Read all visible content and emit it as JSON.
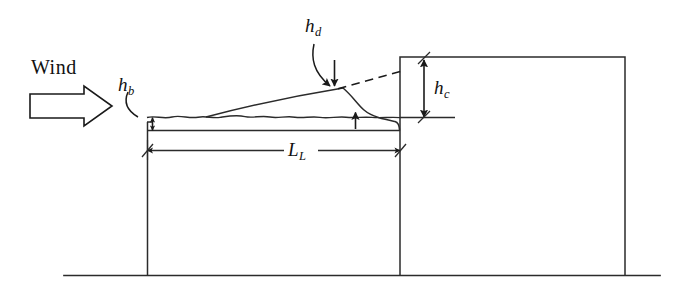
{
  "figure": {
    "type": "engineering-diagram",
    "background_color": "#ffffff",
    "line_color": "#1a1a1a"
  },
  "labels": {
    "wind": "Wind",
    "h_b_base": "h",
    "h_b_sub": "b",
    "h_d_base": "h",
    "h_d_sub": "d",
    "h_c_base": "h",
    "h_c_sub": "c",
    "L_L_base": "L",
    "L_L_sub": "L"
  },
  "annotations": {
    "wind_arrow": "hollow-block-arrow-pointing-right",
    "h_b": "balanced-snow-depth-on-lower-roof",
    "h_d": "drift-height-above-balanced-snow",
    "h_c": "clear-height-from-balanced-snow-to-upper-roof",
    "L_L": "length-of-lower-roof"
  },
  "geometry": {
    "lower_roof_deck_y": 130,
    "balanced_snow_surface_y": 117,
    "lower_roof_left_wall_x": 147,
    "lower_roof_right_x": 400,
    "upper_roof_top_y": 57,
    "upper_roof_right_wall_x": 625,
    "ground_line_y": 275,
    "ground_line_x_start": 64,
    "ground_line_x_end": 660
  }
}
